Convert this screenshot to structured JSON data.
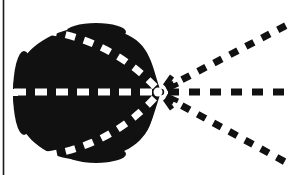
{
  "figure": {
    "title": "Teardrop lobe with three dashed rays converging at a focal point",
    "caption": "",
    "background_color": "#ffffff",
    "ink_color": "#111111",
    "highlight_color": "#ffffff",
    "canvas": {
      "width": 293,
      "height": 175
    },
    "border": {
      "name": "left-rule",
      "present": true,
      "orientation": "vertical",
      "x": 3.5,
      "y_start": 0,
      "y_end": 175,
      "thickness": 1.6,
      "color": "#1a1a1a"
    },
    "focal_point": {
      "label": "focus",
      "x": 161,
      "y": 92
    },
    "lobe": {
      "name": "teardrop-lobe",
      "fill": "#111111",
      "center": {
        "x": 88,
        "y": 93
      },
      "radius_x": 74,
      "radius_y": 66,
      "tip": {
        "x": 161,
        "y": 92
      },
      "path": "M 161 92 C 152 68 152 44 124 34 C 100 25 68 25 44 40 C 20 55 14 76 14 93 C 14 112 20 133 43 148 C 67 163 100 163 124 152 C 152 140 152 116 161 92 Z"
    },
    "rays": [
      {
        "name": "upper-ray",
        "angle_deg": -32,
        "from": {
          "x": 161,
          "y": 92
        },
        "to": {
          "x": 286,
          "y": 26
        },
        "dash_color": "#111111",
        "dash_pattern": "9 9",
        "stroke_width": 7
      },
      {
        "name": "middle-ray",
        "angle_deg": 0,
        "from": {
          "x": 161,
          "y": 92
        },
        "to": {
          "x": 290,
          "y": 92
        },
        "dash_color": "#111111",
        "dash_pattern": "11 10",
        "stroke_width": 7
      },
      {
        "name": "lower-ray",
        "angle_deg": 30,
        "from": {
          "x": 161,
          "y": 92
        },
        "to": {
          "x": 288,
          "y": 163
        },
        "dash_color": "#111111",
        "dash_pattern": "9 9",
        "stroke_width": 7
      }
    ],
    "inner_lines": [
      {
        "name": "upper-inner-line",
        "from": {
          "x": 47,
          "y": 31
        },
        "to": {
          "x": 161,
          "y": 92
        },
        "control": {
          "x": 112,
          "y": 40
        },
        "dash_color": "#ffffff",
        "dash_pattern": "10 9",
        "stroke_width": 7
      },
      {
        "name": "axis-inner-line",
        "from": {
          "x": 15,
          "y": 92
        },
        "to": {
          "x": 161,
          "y": 92
        },
        "dash_color": "#ffffff",
        "dash_pattern": "12 9",
        "stroke_width": 7
      },
      {
        "name": "lower-inner-line",
        "from": {
          "x": 47,
          "y": 154
        },
        "to": {
          "x": 161,
          "y": 92
        },
        "control": {
          "x": 112,
          "y": 145
        },
        "dash_color": "#ffffff",
        "dash_pattern": "10 9",
        "stroke_width": 7
      }
    ],
    "focal_spokes": [
      {
        "name": "spoke-up",
        "angle_deg": -62,
        "length": 11
      },
      {
        "name": "spoke-upmid",
        "angle_deg": -22,
        "length": 10
      },
      {
        "name": "spoke-down",
        "angle_deg": 24,
        "length": 10
      },
      {
        "name": "spoke-downmid",
        "angle_deg": 62,
        "length": 11
      }
    ]
  }
}
